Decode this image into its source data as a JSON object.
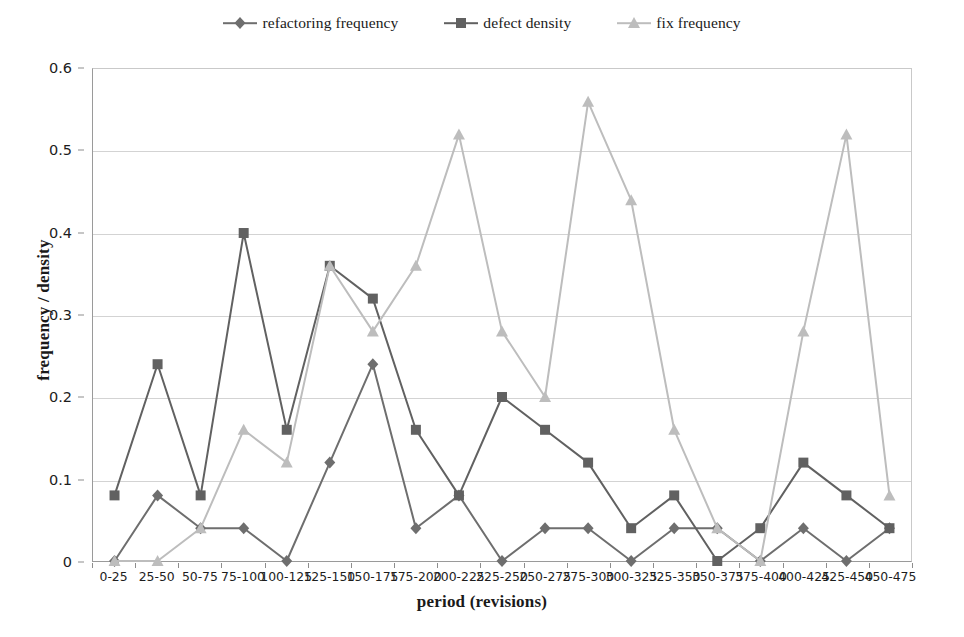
{
  "chart_data": {
    "type": "line",
    "title": "",
    "xlabel": "period (revisions)",
    "ylabel": "frequency / density",
    "ylim": [
      0,
      0.6
    ],
    "yticks": [
      "0",
      "0.1",
      "0.2",
      "0.3",
      "0.4",
      "0.5",
      "0.6"
    ],
    "ytick_values": [
      0,
      0.1,
      0.2,
      0.3,
      0.4,
      0.5,
      0.6
    ],
    "grid": "horizontal",
    "legend_position": "top-center",
    "categories": [
      "0-25",
      "25-50",
      "50-75",
      "75-100",
      "100-125",
      "125-150",
      "150-175",
      "175-200",
      "200-225",
      "225-250",
      "250-275",
      "275-300",
      "300-325",
      "325-350",
      "350-375",
      "375-400",
      "400-425",
      "425-450",
      "450-475"
    ],
    "series": [
      {
        "name": "refactoring frequency",
        "color": "#6e6e6e",
        "marker": "diamond",
        "values": [
          0,
          0.08,
          0.04,
          0.04,
          0,
          0.12,
          0.24,
          0.04,
          0.08,
          0,
          0.04,
          0.04,
          0,
          0.04,
          0.04,
          0,
          0.04,
          0,
          0.04
        ]
      },
      {
        "name": "defect density",
        "color": "#616161",
        "marker": "square",
        "values": [
          0.08,
          0.24,
          0.08,
          0.4,
          0.16,
          0.36,
          0.32,
          0.16,
          0.08,
          0.2,
          0.16,
          0.12,
          0.04,
          0.08,
          0,
          0.04,
          0.12,
          0.08,
          0.04
        ]
      },
      {
        "name": "fix frequency",
        "color": "#bdbdbd",
        "marker": "triangle",
        "values": [
          0,
          0,
          0.04,
          0.16,
          0.12,
          0.36,
          0.28,
          0.36,
          0.52,
          0.28,
          0.2,
          0.56,
          0.44,
          0.16,
          0.04,
          0,
          0.28,
          0.52,
          0.08
        ]
      }
    ]
  },
  "legend": {
    "items": [
      {
        "label": "refactoring frequency",
        "color": "#6e6e6e",
        "marker": "diamond"
      },
      {
        "label": "defect density",
        "color": "#616161",
        "marker": "square"
      },
      {
        "label": "fix frequency",
        "color": "#bdbdbd",
        "marker": "triangle"
      }
    ]
  }
}
